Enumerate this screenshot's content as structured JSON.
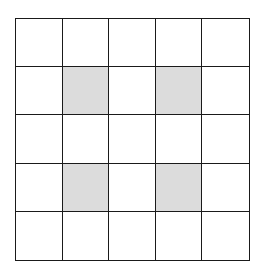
{
  "grid": {
    "rows": 5,
    "cols": 5,
    "shaded_cells": [
      [
        1,
        1
      ],
      [
        1,
        3
      ],
      [
        3,
        1
      ],
      [
        3,
        3
      ]
    ],
    "colors": {
      "line": "#1a1a1a",
      "shaded": "#dcdcdc",
      "empty": "#ffffff"
    }
  }
}
